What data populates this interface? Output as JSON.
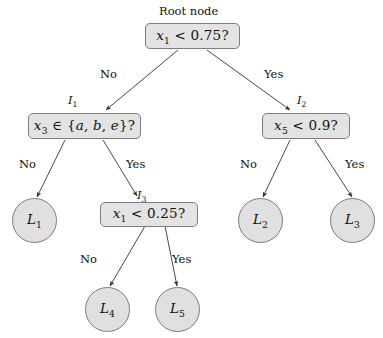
{
  "diagram": {
    "type": "decision-tree",
    "background_color": "#ffffff",
    "node_fill_color": "#e3e3e3",
    "node_border_color": "#7d7d7d",
    "edge_color": "#333333",
    "root_caption": "Root node",
    "internal_nodes": [
      {
        "id": "root",
        "tag": "",
        "condition": "x1 < 0.75?",
        "var": "x",
        "sub": "1",
        "rest": " < 0.75?"
      },
      {
        "id": "I1",
        "tag": "I1",
        "condition": "x3 ∈ {a, b, e}?",
        "var": "x",
        "sub": "3",
        "rest": " ∈ {a, b, e}?"
      },
      {
        "id": "I2",
        "tag": "I2",
        "condition": "x5 < 0.9?",
        "var": "x",
        "sub": "5",
        "rest": " < 0.9?"
      },
      {
        "id": "I3",
        "tag": "I3",
        "condition": "x1 < 0.25?",
        "var": "x",
        "sub": "1",
        "rest": " < 0.25?"
      }
    ],
    "tags": {
      "I1": "I",
      "I1_sub": "1",
      "I2": "I",
      "I2_sub": "2",
      "I3": "I",
      "I3_sub": "3"
    },
    "leaves": [
      {
        "id": "L1",
        "letter": "L",
        "sub": "1"
      },
      {
        "id": "L2",
        "letter": "L",
        "sub": "2"
      },
      {
        "id": "L3",
        "letter": "L",
        "sub": "3"
      },
      {
        "id": "L4",
        "letter": "L",
        "sub": "4"
      },
      {
        "id": "L5",
        "letter": "L",
        "sub": "5"
      }
    ],
    "edge_labels": {
      "root_left": "No",
      "root_right": "Yes",
      "i1_left": "No",
      "i1_right": "Yes",
      "i2_left": "No",
      "i2_right": "Yes",
      "i3_left": "No",
      "i3_right": "Yes"
    }
  }
}
